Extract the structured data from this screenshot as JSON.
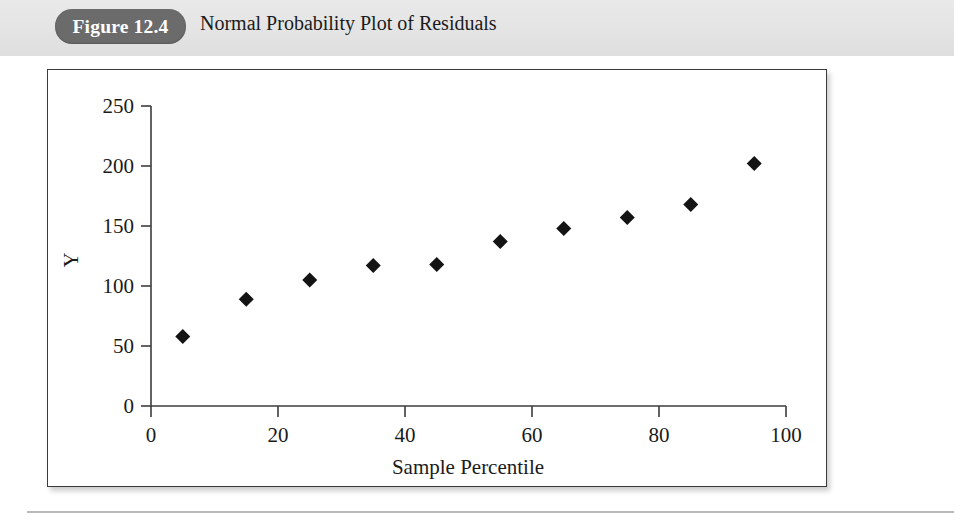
{
  "header": {
    "badge_label": "Figure 12.4",
    "title": "Normal Probability Plot of Residuals",
    "badge_color": "#6b6b6b",
    "band_color": "#e4e4e4"
  },
  "chart_data": {
    "type": "scatter",
    "title": "Normal Probability Plot of Residuals",
    "xlabel": "Sample Percentile",
    "ylabel": "Y",
    "xlim": [
      0,
      100
    ],
    "ylim": [
      0,
      250
    ],
    "xticks": [
      "0",
      "20",
      "40",
      "60",
      "80",
      "100"
    ],
    "yticks": [
      "0",
      "50",
      "100",
      "150",
      "200",
      "250"
    ],
    "xtick_values": [
      0,
      20,
      40,
      60,
      80,
      100
    ],
    "ytick_values": [
      0,
      50,
      100,
      150,
      200,
      250
    ],
    "grid": false,
    "legend": false,
    "marker": "diamond",
    "marker_color": "#141414",
    "x": [
      5,
      15,
      25,
      35,
      45,
      55,
      65,
      75,
      85,
      95
    ],
    "values": [
      58,
      89,
      105,
      117,
      118,
      137,
      148,
      157,
      168,
      202
    ],
    "points": [
      {
        "x": 5,
        "y": 58
      },
      {
        "x": 15,
        "y": 89
      },
      {
        "x": 25,
        "y": 105
      },
      {
        "x": 35,
        "y": 117
      },
      {
        "x": 45,
        "y": 118
      },
      {
        "x": 55,
        "y": 137
      },
      {
        "x": 65,
        "y": 148
      },
      {
        "x": 75,
        "y": 157
      },
      {
        "x": 85,
        "y": 168
      },
      {
        "x": 95,
        "y": 202
      }
    ]
  }
}
